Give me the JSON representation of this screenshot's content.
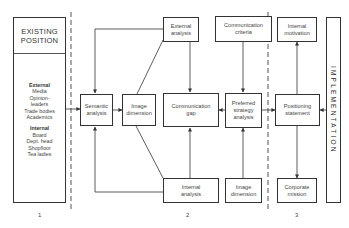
{
  "existing_position": {
    "title_line1": "EXISTING",
    "title_line2": "POSITION",
    "external_heading": "External",
    "external_items": [
      "Media",
      "Opinion-",
      "leaders",
      "Trade bodies",
      "Academics"
    ],
    "internal_heading": "Internal",
    "internal_items": [
      "Board",
      "Dept. head",
      "Shopfloor",
      "Tea ladies"
    ]
  },
  "boxes": {
    "semantic_analysis": [
      "Semantic",
      "analysis"
    ],
    "image_dimension_mid": [
      "Image",
      "dimension"
    ],
    "external_analysis": [
      "External",
      "analysis"
    ],
    "communication_gap": [
      "Communication",
      "gap"
    ],
    "internal_analysis": [
      "Internal",
      "analysis"
    ],
    "communication_criteria": [
      "Communication",
      "criteria"
    ],
    "preferred_strategy": [
      "Preferred",
      "strategy",
      "analysis"
    ],
    "image_dimension_bottom": [
      "Image",
      "dimension"
    ],
    "internal_motivation": [
      "Internal",
      "motivation"
    ],
    "positioning_statement": [
      "Positioning",
      "statement"
    ],
    "corporate_mission": [
      "Corporate",
      "mission"
    ]
  },
  "implementation": "IMPLEMENTATION",
  "section_numbers": [
    "1",
    "2",
    "3"
  ]
}
